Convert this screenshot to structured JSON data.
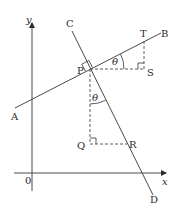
{
  "diagram": {
    "type": "coordinate-geometry",
    "axes": {
      "x_label": "x",
      "y_label": "y",
      "origin_label": "0"
    },
    "lines": [
      {
        "name": "AB",
        "start_label": "A",
        "end_label": "B",
        "style": "solid"
      },
      {
        "name": "CD",
        "start_label": "C",
        "end_label": "D",
        "style": "solid"
      }
    ],
    "points": {
      "A": "A",
      "B": "B",
      "C": "C",
      "D": "D",
      "P": "P",
      "Q": "Q",
      "R": "R",
      "S": "S",
      "T": "T"
    },
    "angles": {
      "angle_TPS": "θ",
      "angle_QPR": "θ"
    },
    "right_angles": [
      "APC (at P between AB and CD)",
      "PST (at S)",
      "PQR (at Q)"
    ],
    "dashed_segments": [
      "PS",
      "ST",
      "PQ",
      "QR"
    ],
    "colors": {
      "line": "#4a4a4a",
      "text": "#2a2a2a",
      "background": "#ffffff"
    }
  }
}
